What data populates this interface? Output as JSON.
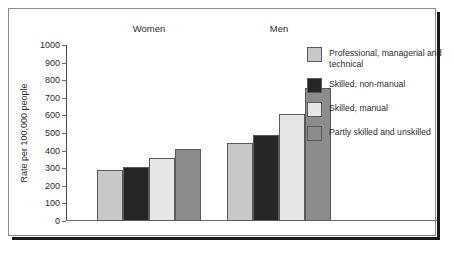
{
  "chart_data": {
    "type": "bar",
    "title": "",
    "xlabel": "",
    "ylabel": "Rate per 100,000 people",
    "ylim": [
      0,
      1000
    ],
    "ytick_step": 100,
    "yticks": [
      0,
      100,
      200,
      300,
      400,
      500,
      600,
      700,
      800,
      900,
      1000
    ],
    "ytick_labels": [
      "0",
      "100",
      "200",
      "300",
      "400",
      "500",
      "600",
      "700",
      "800",
      "900",
      "1000"
    ],
    "categories": [
      "Women",
      "Men"
    ],
    "grid": false,
    "legend_position": "right",
    "series": [
      {
        "name": "Professional, managerial and technical",
        "color": "#c8c8c8",
        "values": [
          290,
          445
        ]
      },
      {
        "name": "Skilled, non-manual",
        "color": "#262626",
        "values": [
          305,
          488
        ]
      },
      {
        "name": "Skilled, manual",
        "color": "#e6e6e6",
        "values": [
          360,
          608
        ]
      },
      {
        "name": "Partly skilled and unskilled",
        "color": "#8c8c8c",
        "values": [
          410,
          755
        ]
      }
    ]
  },
  "legend": {
    "items": [
      {
        "label": "Professional, managerial and technical",
        "color": "#c8c8c8"
      },
      {
        "label": "Skilled, non-manual",
        "color": "#262626"
      },
      {
        "label": "Skilled, manual",
        "color": "#e6e6e6"
      },
      {
        "label": "Partly skilled and unskilled",
        "color": "#8c8c8c"
      }
    ]
  }
}
